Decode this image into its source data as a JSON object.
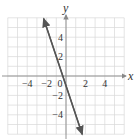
{
  "chart_data": {
    "type": "line",
    "title": "",
    "xlabel": "x",
    "ylabel": "y",
    "xlim": [
      -6,
      6
    ],
    "ylim": [
      -6,
      6
    ],
    "grid": true,
    "x_ticks": [
      -4,
      -2,
      0,
      2,
      4
    ],
    "y_ticks": [
      4,
      2,
      -2,
      -4
    ],
    "tick_labels": {
      "x": [
        "-4",
        "-2",
        "0",
        "2",
        "4"
      ],
      "y": [
        "4",
        "2",
        "-2",
        "-4"
      ]
    },
    "series": [
      {
        "name": "line",
        "equation": "y = -3x - 1",
        "slope": -3,
        "intercept": -1,
        "x": [
          -2.3,
          1.67
        ],
        "y": [
          5.9,
          -6.0
        ],
        "arrows": "both"
      }
    ],
    "colors": {
      "line": "#555555",
      "grid": "#d8d8d8",
      "axis": "#888888"
    }
  }
}
